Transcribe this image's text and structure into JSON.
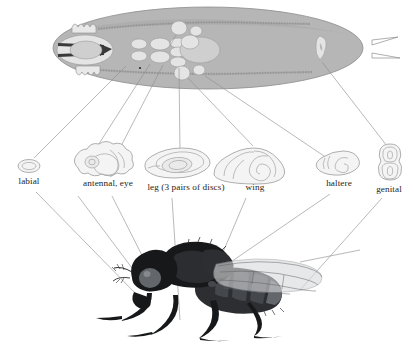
{
  "figure": {
    "domain": "biology-diagram",
    "background_color": "#ffffff",
    "larva_color": "#b6b6b6",
    "disc_fill": "#f4f4f4",
    "disc_stroke": "#9a9a9a",
    "leader_color": "#8d8d8d",
    "fly_color": "#17181a"
  },
  "panels": {
    "larva": {
      "name": "third-instar larva",
      "position": "top",
      "has_mouth_hooks": true,
      "has_tracheal_trunks": true
    },
    "discs_row": {
      "position": "middle",
      "count": 6
    },
    "adult_fly": {
      "name": "adult fly",
      "position": "bottom",
      "view": "lateral"
    }
  },
  "discs": [
    {
      "id": "labial",
      "label": "labial",
      "label_x": 29,
      "label_y": 184,
      "shape": "small-oval"
    },
    {
      "id": "antennal",
      "label": "antennal, eye",
      "label_x": 108,
      "label_y": 186,
      "shape": "lobed-folded"
    },
    {
      "id": "leg",
      "label": "leg (3 pairs of discs)",
      "label_x": 186,
      "label_y": 190,
      "shape": "oval-concentric"
    },
    {
      "id": "wing",
      "label": "wing",
      "label_x": 255,
      "label_y": 190,
      "shape": "teardrop-spiral"
    },
    {
      "id": "haltere",
      "label": "haltere",
      "label_x": 339,
      "label_y": 186,
      "shape": "small-teardrop"
    },
    {
      "id": "genital",
      "label": "genital",
      "label_x": 389,
      "label_y": 192,
      "shape": "figure-eight"
    }
  ]
}
